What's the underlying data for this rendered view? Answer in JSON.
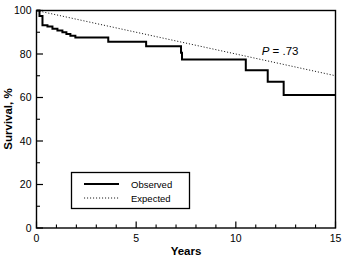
{
  "chart_data": {
    "type": "line",
    "title": "",
    "xlabel": "Years",
    "ylabel": "Survival, %",
    "xlim": [
      0,
      15
    ],
    "ylim": [
      0,
      100
    ],
    "grid": false,
    "legend_position": "lower-left-inside",
    "x_major_ticks": [
      0,
      5,
      10,
      15
    ],
    "x_major_tick_labels": [
      "0",
      "5",
      "10",
      "15"
    ],
    "x_minor_ticks": [
      1,
      2,
      3,
      4,
      6,
      7,
      8,
      9,
      11,
      12,
      13,
      14
    ],
    "y_major_ticks": [
      0,
      20,
      40,
      60,
      80,
      100
    ],
    "y_major_tick_labels": [
      "0",
      "20",
      "40",
      "60",
      "80",
      "100"
    ],
    "y_minor_ticks": [
      10,
      30,
      50,
      70,
      90
    ],
    "annotations": [
      {
        "name": "p-value",
        "text_prefix": "P",
        "text_suffix": " = .73",
        "x": 11.3,
        "y": 79.5
      }
    ],
    "series": [
      {
        "name": "Observed",
        "style": "solid",
        "width": 2.0,
        "color": "#000000",
        "step": "post",
        "points": [
          [
            0.0,
            100.0
          ],
          [
            0.15,
            97.5
          ],
          [
            0.3,
            93.2
          ],
          [
            0.55,
            92.6
          ],
          [
            0.8,
            91.6
          ],
          [
            1.05,
            90.8
          ],
          [
            1.3,
            90.0
          ],
          [
            1.5,
            89.2
          ],
          [
            1.7,
            88.4
          ],
          [
            1.95,
            87.6
          ],
          [
            3.45,
            87.6
          ],
          [
            3.6,
            85.6
          ],
          [
            5.35,
            85.6
          ],
          [
            5.5,
            83.6
          ],
          [
            7.1,
            83.6
          ],
          [
            7.25,
            80.6
          ],
          [
            7.3,
            77.5
          ],
          [
            10.35,
            77.5
          ],
          [
            10.5,
            72.5
          ],
          [
            11.45,
            72.5
          ],
          [
            11.6,
            67.2
          ],
          [
            12.25,
            67.2
          ],
          [
            12.4,
            61.2
          ],
          [
            15.0,
            61.2
          ]
        ]
      },
      {
        "name": "Expected",
        "style": "dotted",
        "width": 0.9,
        "color": "#000000",
        "points": [
          [
            0.0,
            100.0
          ],
          [
            15.0,
            70.0
          ]
        ]
      }
    ],
    "legend": {
      "entries": [
        {
          "label": "Observed",
          "style": "solid"
        },
        {
          "label": "Expected",
          "style": "dotted"
        }
      ]
    }
  }
}
